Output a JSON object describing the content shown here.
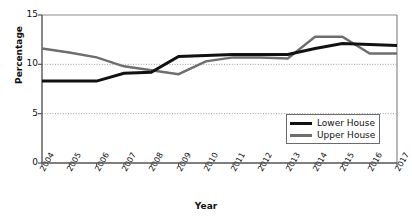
{
  "chart_data": {
    "type": "line",
    "title": "",
    "xlabel": "Year",
    "ylabel": "Percentage",
    "categories": [
      "2004",
      "2005",
      "2006",
      "2007",
      "2008",
      "2009",
      "2010",
      "2011",
      "2012",
      "2013",
      "2014",
      "2015",
      "2016",
      "2017"
    ],
    "ylim": [
      0,
      15
    ],
    "yticks": [
      "0",
      "5",
      "10",
      "15"
    ],
    "ytick_values": [
      0,
      5,
      10,
      15
    ],
    "grid": "horizontal-dotted at 5 and 10",
    "legend_position": "bottom-right inside plot",
    "series": [
      {
        "name": "Lower House",
        "color": "#111111",
        "values": [
          8.3,
          8.3,
          8.3,
          9.1,
          9.2,
          10.8,
          10.9,
          11.0,
          11.0,
          11.0,
          11.6,
          12.1,
          12.0,
          11.9
        ]
      },
      {
        "name": "Upper House",
        "color": "#6e6e6e",
        "values": [
          11.6,
          11.2,
          10.7,
          9.8,
          9.4,
          9.0,
          10.3,
          10.7,
          10.7,
          10.6,
          12.8,
          12.8,
          11.1,
          11.1
        ]
      }
    ]
  },
  "axis": {
    "y_title": "Percentage",
    "x_title": "Year"
  },
  "legend": {
    "items": [
      {
        "label": "Lower House"
      },
      {
        "label": "Upper House"
      }
    ]
  }
}
